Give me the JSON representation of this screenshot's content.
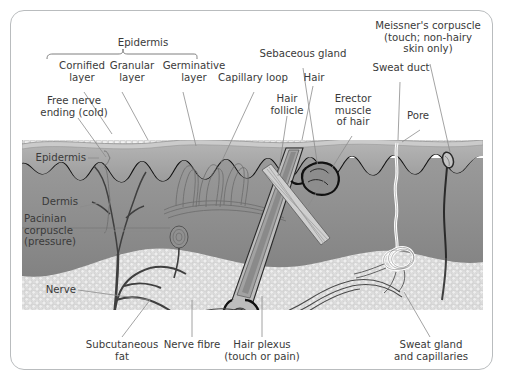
{
  "figure": {
    "frame_color": "#b9bcbe",
    "background": "#ffffff",
    "text_color": "#3a3a3a"
  },
  "palette": {
    "cornified_layer": "#e4e4e4",
    "granular_layer": "#cfcfcf",
    "germinative_layer": "#a8a8a8",
    "dermis": "#8f8f8f",
    "subcutaneous_fat": "#d8d8d8",
    "nerve": "#4a4a4a",
    "hair_shaft": "#b5b5b5",
    "sweat_duct": "#ffffff",
    "outline": "#111111"
  },
  "labels": {
    "epidermis_group": "Epidermis",
    "cornified_layer": "Cornified\nlayer",
    "granular_layer": "Granular\nlayer",
    "germinative_layer": "Germinative\nlayer",
    "free_nerve_ending": "Free nerve\nending (cold)",
    "capillary_loop": "Capillary loop",
    "sebaceous_gland": "Sebaceous gland",
    "hair": "Hair",
    "hair_follicle": "Hair\nfollicle",
    "erector_muscle": "Erector\nmuscle\nof hair",
    "sweat_duct": "Sweat duct",
    "meissners_corpuscle": "Meissner's corpuscle\n(touch; non-hairy\nskin only)",
    "pore": "Pore",
    "epidermis_side": "Epidermis",
    "dermis_side": "Dermis",
    "pacinian_corpuscle": "Pacinian\ncorpuscle\n(pressure)",
    "nerve": "Nerve",
    "subcutaneous_fat": "Subcutaneous\nfat",
    "nerve_fibre": "Nerve fibre",
    "hair_plexus": "Hair plexus\n(touch or pain)",
    "sweat_gland": "Sweat gland\nand capillaries"
  },
  "structures": [
    {
      "name": "cornified-layer",
      "type": "layer",
      "description": "Outer stippled keratin band"
    },
    {
      "name": "granular-layer",
      "type": "layer",
      "description": "Thin line beneath cornified layer"
    },
    {
      "name": "germinative-layer",
      "type": "layer",
      "description": "Basal epidermal layer with wavy lower border"
    },
    {
      "name": "dermis",
      "type": "layer",
      "description": "Thick mid-grey connective layer"
    },
    {
      "name": "subcutaneous-fat",
      "type": "layer",
      "description": "Stippled adipose tissue at base"
    },
    {
      "name": "hair-shaft",
      "type": "appendage",
      "description": "Angled shaft emerging through epidermis"
    },
    {
      "name": "hair-follicle",
      "type": "appendage",
      "description": "Sheath descending into subcutaneous fat"
    },
    {
      "name": "sebaceous-gland",
      "type": "gland",
      "description": "Lobed gland opening into follicle"
    },
    {
      "name": "erector-muscle",
      "type": "muscle",
      "description": "Oblique band from follicle to epidermis"
    },
    {
      "name": "sweat-duct",
      "type": "duct",
      "description": "White wavy duct from gland to pore"
    },
    {
      "name": "sweat-gland",
      "type": "gland",
      "description": "Coiled tubule in deep dermis"
    },
    {
      "name": "pacinian-corpuscle",
      "type": "receptor",
      "description": "Onion-like pressure receptor"
    },
    {
      "name": "meissners-corpuscle",
      "type": "receptor",
      "description": "Ovoid touch receptor in dermal papilla"
    },
    {
      "name": "free-nerve-ending",
      "type": "receptor",
      "description": "Branching fibres reaching epidermis"
    },
    {
      "name": "hair-plexus",
      "type": "receptor",
      "description": "Nerve fibres wrapping follicle base"
    },
    {
      "name": "capillary-loop",
      "type": "vessel",
      "description": "Hairpin capillaries in dermal papillae"
    },
    {
      "name": "nerve",
      "type": "nerve",
      "description": "Main nerve trunk in subcutaneous fat"
    }
  ]
}
